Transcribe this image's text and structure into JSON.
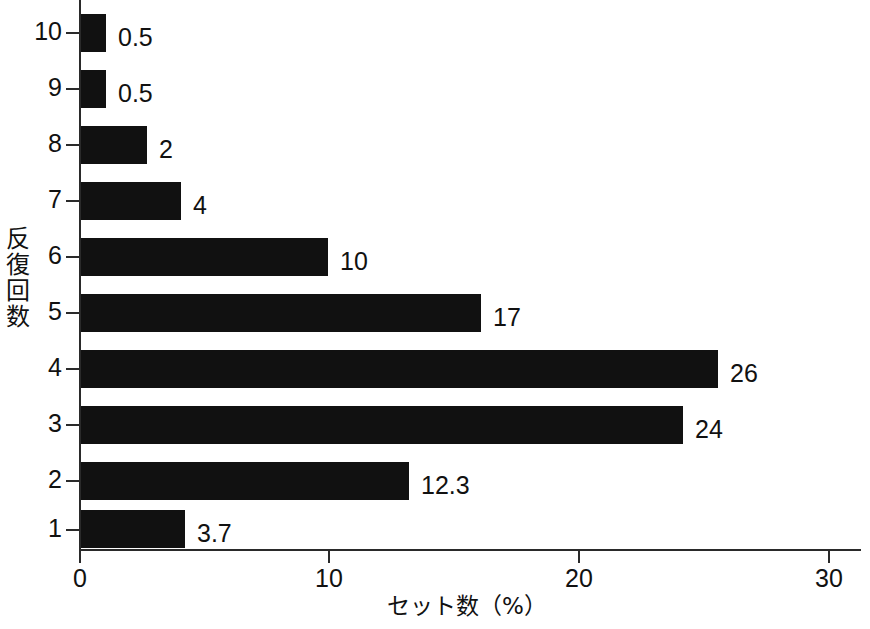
{
  "chart_data": {
    "type": "bar",
    "orientation": "horizontal",
    "title": "",
    "subtitle": "",
    "xlabel": "セット数（%）",
    "ylabel": "反復回数",
    "ylabel_chars": [
      "反",
      "復",
      "回",
      "数"
    ],
    "categories": [
      "1",
      "2",
      "3",
      "4",
      "5",
      "6",
      "7",
      "8",
      "9",
      "10"
    ],
    "values": [
      3.7,
      12.3,
      24,
      26,
      17,
      10,
      4,
      2,
      0.5,
      0.5
    ],
    "value_labels": [
      "3.7",
      "12.3",
      "24",
      "26",
      "17",
      "10",
      "4",
      "2",
      "0.5",
      "0.5"
    ],
    "xlim": [
      0,
      31.4
    ],
    "x_ticks": [
      0,
      10,
      20,
      30
    ],
    "x_tick_labels": [
      "0",
      "10",
      "20",
      "30"
    ],
    "grid": false,
    "legend": false,
    "bar_color": "#111111",
    "axis_color": "#2a2a2a",
    "background_color": "#ffffff",
    "bars": [
      {
        "category": "10",
        "value": 0.5,
        "label": "0.5",
        "top": 14,
        "length": 25
      },
      {
        "category": "9",
        "value": 0.5,
        "label": "0.5",
        "top": 70,
        "length": 25
      },
      {
        "category": "8",
        "value": 2,
        "label": "2",
        "top": 126,
        "length": 66
      },
      {
        "category": "7",
        "value": 4,
        "label": "4",
        "top": 182,
        "length": 100
      },
      {
        "category": "6",
        "value": 10,
        "label": "10",
        "top": 238,
        "length": 247
      },
      {
        "category": "5",
        "value": 17,
        "label": "17",
        "top": 294,
        "length": 400
      },
      {
        "category": "4",
        "value": 26,
        "label": "26",
        "top": 350,
        "length": 637
      },
      {
        "category": "3",
        "value": 24,
        "label": "24",
        "top": 406,
        "length": 602
      },
      {
        "category": "2",
        "value": 12.3,
        "label": "12.3",
        "top": 462,
        "length": 328
      },
      {
        "category": "1",
        "value": 3.7,
        "label": "3.7",
        "top": 510,
        "length": 104
      }
    ],
    "y_ticks": [
      {
        "label": "10",
        "top": 32
      },
      {
        "label": "9",
        "top": 88
      },
      {
        "label": "8",
        "top": 144
      },
      {
        "label": "7",
        "top": 200
      },
      {
        "label": "6",
        "top": 256
      },
      {
        "label": "5",
        "top": 312
      },
      {
        "label": "4",
        "top": 368
      },
      {
        "label": "3",
        "top": 424
      },
      {
        "label": "2",
        "top": 480
      },
      {
        "label": "1",
        "top": 529
      }
    ],
    "x_tick_positions": [
      {
        "label": "0",
        "left": 79
      },
      {
        "label": "10",
        "left": 328
      },
      {
        "label": "20",
        "left": 578
      },
      {
        "label": "30",
        "left": 828
      }
    ]
  }
}
